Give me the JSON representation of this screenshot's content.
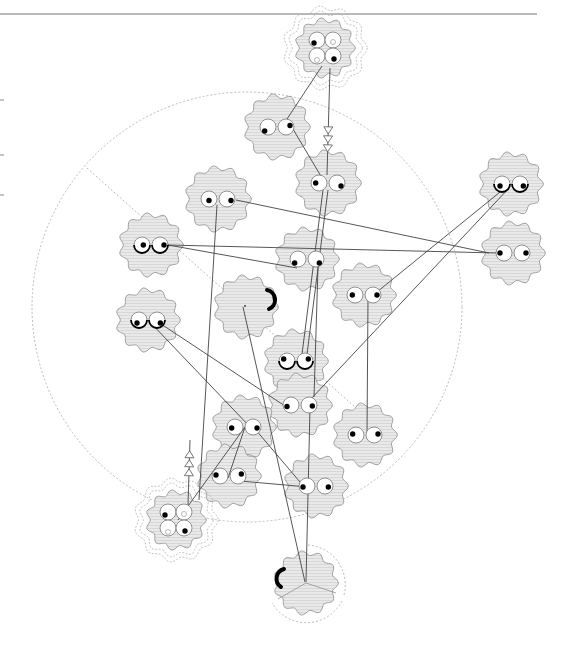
{
  "diagram": {
    "width": 569,
    "height": 653,
    "colors": {
      "background": "#ffffff",
      "cloud_fill": "#e6e6e6",
      "cloud_stroke": "#9a9a9a",
      "edge": "#444444",
      "guide": "#aaaaaa",
      "top_rule": "#777777",
      "pupil": "#000000"
    },
    "top_rule": {
      "x1": 0,
      "y1": 14,
      "x2": 537,
      "y2": 14
    },
    "left_ticks": [
      100,
      155,
      195
    ],
    "guide_circle": {
      "cx": 247,
      "cy": 307,
      "r": 215
    },
    "guide_diagonal": {
      "x1": 87,
      "y1": 168,
      "x2": 392,
      "y2": 440
    },
    "nodes": [
      {
        "id": "n-top-quad",
        "cx": 325,
        "cy": 48,
        "r": 28,
        "kind": "quad",
        "halo": true
      },
      {
        "id": "n1",
        "cx": 277,
        "cy": 127,
        "r": 31,
        "kind": "eyes",
        "pupils": [
          [
            -10,
            8
          ],
          [
            12,
            -3
          ]
        ]
      },
      {
        "id": "n2",
        "cx": 328,
        "cy": 183,
        "r": 31,
        "kind": "eyes",
        "pupils": [
          [
            -10,
            0
          ],
          [
            12,
            6
          ]
        ]
      },
      {
        "id": "n3",
        "cx": 218,
        "cy": 199,
        "r": 31,
        "kind": "eyes",
        "pupils": [
          [
            0,
            3
          ],
          [
            12,
            3
          ]
        ]
      },
      {
        "id": "n4",
        "cx": 151,
        "cy": 245,
        "r": 30,
        "kind": "eyes",
        "curl": true,
        "pupils": [
          [
            4,
            0
          ],
          [
            16,
            0
          ]
        ]
      },
      {
        "id": "n5",
        "cx": 307,
        "cy": 259,
        "r": 30,
        "kind": "eyes",
        "pupils": [
          [
            -10,
            8
          ],
          [
            10,
            8
          ]
        ]
      },
      {
        "id": "n6",
        "cx": 246,
        "cy": 307,
        "r": 30,
        "kind": "arc"
      },
      {
        "id": "n7",
        "cx": 148,
        "cy": 320,
        "r": 30,
        "kind": "eyes",
        "curl": true,
        "pupils": [
          [
            -6,
            6
          ],
          [
            10,
            6
          ]
        ]
      },
      {
        "id": "n8",
        "cx": 364,
        "cy": 295,
        "r": 30,
        "kind": "eyes",
        "pupils": [
          [
            -8,
            0
          ],
          [
            12,
            0
          ]
        ]
      },
      {
        "id": "n9",
        "cx": 511,
        "cy": 184,
        "r": 30,
        "kind": "eyes",
        "curl": true,
        "pupils": [
          [
            -6,
            4
          ],
          [
            10,
            4
          ]
        ]
      },
      {
        "id": "n10",
        "cx": 513,
        "cy": 253,
        "r": 30,
        "kind": "eyes",
        "pupils": [
          [
            -12,
            0
          ],
          [
            12,
            0
          ]
        ]
      },
      {
        "id": "n11",
        "cx": 296,
        "cy": 361,
        "r": 30,
        "kind": "eyes",
        "curl": true,
        "pupils": [
          [
            -10,
            -4
          ],
          [
            10,
            -4
          ]
        ]
      },
      {
        "id": "n12",
        "cx": 300,
        "cy": 405,
        "r": 30,
        "kind": "eyes",
        "pupils": [
          [
            -12,
            3
          ],
          [
            10,
            2
          ]
        ]
      },
      {
        "id": "n13",
        "cx": 365,
        "cy": 435,
        "r": 30,
        "kind": "eyes",
        "pupils": [
          [
            -10,
            -2
          ],
          [
            12,
            -2
          ]
        ]
      },
      {
        "id": "n14",
        "cx": 244,
        "cy": 427,
        "r": 30,
        "kind": "eyes",
        "pupils": [
          [
            -10,
            2
          ],
          [
            12,
            2
          ]
        ]
      },
      {
        "id": "n15",
        "cx": 229,
        "cy": 476,
        "r": 30,
        "kind": "eyes",
        "pupils": [
          [
            -12,
            -2
          ],
          [
            10,
            -4
          ]
        ]
      },
      {
        "id": "n16",
        "cx": 316,
        "cy": 486,
        "r": 30,
        "kind": "eyes",
        "pupils": [
          [
            -12,
            2
          ],
          [
            10,
            2
          ]
        ]
      },
      {
        "id": "n-bottom-quad",
        "cx": 176,
        "cy": 520,
        "r": 28,
        "kind": "quad",
        "halo": true
      },
      {
        "id": "n-bottom-arc",
        "cx": 306,
        "cy": 583,
        "r": 30,
        "kind": "arc-left",
        "sector": true
      }
    ],
    "edges": [
      {
        "from": [
          322,
          66
        ],
        "to": [
          287,
          119
        ]
      },
      {
        "from": [
          287,
          119
        ],
        "to": [
          325,
          183
        ]
      },
      {
        "from": [
          330,
          68
        ],
        "to": [
          327,
          175
        ],
        "arrows": 3
      },
      {
        "from": [
          236,
          200
        ],
        "to": [
          489,
          253
        ]
      },
      {
        "from": [
          168,
          245
        ],
        "to": [
          497,
          253
        ]
      },
      {
        "from": [
          168,
          245
        ],
        "to": [
          297,
          268
        ]
      },
      {
        "from": [
          217,
          205
        ],
        "to": [
          199,
          500
        ]
      },
      {
        "from": [
          323,
          190
        ],
        "to": [
          301,
          362
        ]
      },
      {
        "from": [
          328,
          190
        ],
        "to": [
          306,
          362
        ]
      },
      {
        "from": [
          318,
          267
        ],
        "to": [
          314,
          397
        ]
      },
      {
        "from": [
          505,
          188
        ],
        "to": [
          372,
          296
        ]
      },
      {
        "from": [
          509,
          188
        ],
        "to": [
          310,
          400
        ]
      },
      {
        "from": [
          148,
          320
        ],
        "to": [
          252,
          429
        ]
      },
      {
        "from": [
          155,
          320
        ],
        "to": [
          288,
          408
        ]
      },
      {
        "from": [
          243,
          307
        ],
        "to": [
          305,
          582
        ]
      },
      {
        "from": [
          368,
          297
        ],
        "to": [
          367,
          435
        ]
      },
      {
        "from": [
          310,
          407
        ],
        "to": [
          306,
          582
        ]
      },
      {
        "from": [
          245,
          427
        ],
        "to": [
          178,
          520
        ]
      },
      {
        "from": [
          245,
          427
        ],
        "to": [
          228,
          478
        ]
      },
      {
        "from": [
          255,
          429
        ],
        "to": [
          300,
          482
        ]
      },
      {
        "from": [
          240,
          481
        ],
        "to": [
          308,
          487
        ]
      },
      {
        "from": [
          188,
          505
        ],
        "to": [
          190,
          440
        ],
        "arrows": 3
      }
    ]
  }
}
